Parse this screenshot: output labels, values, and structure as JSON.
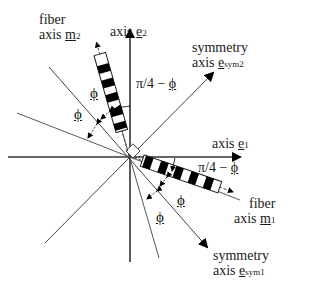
{
  "diagram": {
    "labels": {
      "fiber_m2_line1": "fiber",
      "fiber_m2_line2_prefix": "axis ",
      "fiber_m2_vec": "m",
      "fiber_m2_sub": "2",
      "axis_e2_prefix": "axis ",
      "axis_e2_vec": "e",
      "axis_e2_sub": "2",
      "sym2_line1": "symmetry",
      "sym2_line2_prefix": "axis ",
      "sym2_vec": "e",
      "sym2_sub": "sym2",
      "pi4_top": "π/4 − ",
      "pi4_top_phi": "ϕ",
      "phi_top_1": "ϕ",
      "phi_top_2": "ϕ",
      "axis_e1_prefix": "axis ",
      "axis_e1_vec": "e",
      "axis_e1_sub": "1",
      "pi4_bottom": "π/4 − ",
      "pi4_bottom_phi": "ϕ",
      "fiber_m1_line1": "fiber",
      "fiber_m1_line2_prefix": "axis ",
      "fiber_m1_vec": "m",
      "fiber_m1_sub": "1",
      "phi_bot_1": "ϕ",
      "phi_bot_2": "ϕ",
      "sym1_line1": "symmetry",
      "sym1_line2_prefix": "axis ",
      "sym1_vec": "e",
      "sym1_sub": "sym1"
    },
    "colors": {
      "line": "#333333",
      "fiber_black": "#000000",
      "background": "#ffffff"
    }
  }
}
